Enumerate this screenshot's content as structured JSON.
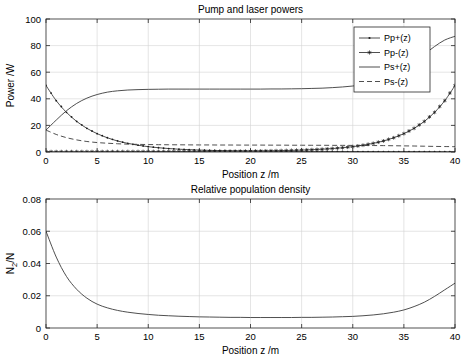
{
  "figure": {
    "width": 470,
    "height": 364,
    "background": "#ffffff",
    "foreground": "#262626",
    "gridcolor": "#d4d4d4"
  },
  "chart_data": [
    {
      "type": "line",
      "id": "pump-and-laser-powers",
      "title": "Pump and laser powers",
      "xlabel": "Position z /m",
      "ylabel": "Power /W",
      "xlim": [
        0,
        40
      ],
      "ylim": [
        0,
        100
      ],
      "xticks": [
        0,
        5,
        10,
        15,
        20,
        25,
        30,
        35,
        40
      ],
      "yticks": [
        0,
        20,
        40,
        60,
        80,
        100
      ],
      "xticklabels": [
        "0",
        "5",
        "10",
        "15",
        "20",
        "25",
        "30",
        "35",
        "40"
      ],
      "yticklabels": [
        "0",
        "20",
        "40",
        "60",
        "80",
        "100"
      ],
      "grid": true,
      "legend_position": "north-east",
      "x": [
        0,
        1,
        2,
        3,
        4,
        5,
        6,
        7,
        8,
        9,
        10,
        11,
        12,
        13,
        14,
        15,
        16,
        17,
        18,
        19,
        20,
        21,
        22,
        23,
        24,
        25,
        26,
        27,
        28,
        29,
        30,
        31,
        32,
        33,
        34,
        35,
        36,
        37,
        38,
        39,
        40
      ],
      "series": [
        {
          "name": "Pp+(z)",
          "style": "solid-with-dot-markers",
          "marker": "dot",
          "values": [
            50.0,
            38.6,
            29.8,
            23.0,
            17.8,
            13.8,
            10.7,
            8.3,
            6.5,
            5.1,
            4.0,
            3.2,
            2.6,
            2.1,
            1.75,
            1.45,
            1.22,
            1.04,
            0.9,
            0.79,
            0.7,
            0.63,
            0.57,
            0.52,
            0.48,
            0.45,
            0.42,
            0.4,
            0.38,
            0.36,
            0.34,
            0.33,
            0.32,
            0.31,
            0.3,
            0.29,
            0.28,
            0.27,
            0.26,
            0.25,
            0.24
          ]
        },
        {
          "name": "Pp-(z)",
          "style": "solid-with-star-markers",
          "marker": "star",
          "values": [
            0.24,
            0.25,
            0.26,
            0.27,
            0.28,
            0.29,
            0.3,
            0.31,
            0.32,
            0.33,
            0.34,
            0.36,
            0.38,
            0.4,
            0.42,
            0.45,
            0.48,
            0.52,
            0.57,
            0.63,
            0.7,
            0.79,
            0.9,
            1.04,
            1.22,
            1.45,
            1.75,
            2.1,
            2.6,
            3.2,
            4.0,
            5.1,
            6.5,
            8.3,
            10.7,
            13.8,
            17.8,
            23.0,
            29.8,
            38.6,
            50.0
          ]
        },
        {
          "name": "Ps+(z)",
          "style": "solid",
          "marker": "none",
          "values": [
            16.5,
            24.0,
            31.0,
            36.5,
            40.5,
            43.2,
            45.0,
            46.0,
            46.6,
            46.9,
            47.1,
            47.2,
            47.3,
            47.3,
            47.3,
            47.3,
            47.3,
            47.3,
            47.3,
            47.3,
            47.3,
            47.3,
            47.4,
            47.4,
            47.5,
            47.6,
            47.8,
            48.0,
            48.4,
            48.9,
            49.6,
            50.7,
            52.3,
            54.6,
            57.8,
            62.0,
            67.3,
            73.4,
            79.3,
            84.2,
            87.0
          ]
        },
        {
          "name": "Ps-(z)",
          "style": "dashed",
          "marker": "none",
          "values": [
            16.5,
            13.2,
            10.8,
            9.1,
            7.9,
            7.1,
            6.6,
            6.2,
            5.9,
            5.75,
            5.6,
            5.5,
            5.45,
            5.4,
            5.35,
            5.3,
            5.3,
            5.25,
            5.25,
            5.2,
            5.2,
            5.2,
            5.15,
            5.15,
            5.1,
            5.1,
            5.05,
            5.05,
            5.0,
            5.0,
            4.95,
            4.9,
            4.85,
            4.8,
            4.7,
            4.6,
            4.5,
            4.35,
            4.2,
            4.1,
            4.0
          ]
        }
      ]
    },
    {
      "type": "line",
      "id": "relative-population-density",
      "title": "Relative population density",
      "xlabel": "Position z /m",
      "ylabel": "N2/N",
      "ylabel_base": "N",
      "ylabel_sub": "2",
      "ylabel_tail": "/N",
      "xlim": [
        0,
        40
      ],
      "ylim": [
        0,
        0.08
      ],
      "xticks": [
        0,
        5,
        10,
        15,
        20,
        25,
        30,
        35,
        40
      ],
      "yticks": [
        0,
        0.02,
        0.04,
        0.06,
        0.08
      ],
      "xticklabels": [
        "0",
        "5",
        "10",
        "15",
        "20",
        "25",
        "30",
        "35",
        "40"
      ],
      "yticklabels": [
        "0",
        "0.02",
        "0.04",
        "0.06",
        "0.08"
      ],
      "grid": true,
      "legend_position": "none",
      "x": [
        0,
        1,
        2,
        3,
        4,
        5,
        6,
        7,
        8,
        9,
        10,
        11,
        12,
        13,
        14,
        15,
        16,
        17,
        18,
        19,
        20,
        21,
        22,
        23,
        24,
        25,
        26,
        27,
        28,
        29,
        30,
        31,
        32,
        33,
        34,
        35,
        36,
        37,
        38,
        39,
        40
      ],
      "series": [
        {
          "name": "N2/N",
          "style": "solid",
          "marker": "none",
          "values": [
            0.06,
            0.044,
            0.032,
            0.024,
            0.0185,
            0.0148,
            0.0125,
            0.0109,
            0.0098,
            0.009,
            0.0084,
            0.0079,
            0.0076,
            0.0073,
            0.0071,
            0.0069,
            0.0068,
            0.0067,
            0.0066,
            0.0066,
            0.0065,
            0.0065,
            0.0065,
            0.0065,
            0.0065,
            0.0066,
            0.0066,
            0.0067,
            0.0068,
            0.007,
            0.0072,
            0.0076,
            0.0081,
            0.0088,
            0.0098,
            0.0112,
            0.0133,
            0.016,
            0.0196,
            0.0237,
            0.0278
          ]
        }
      ]
    }
  ]
}
